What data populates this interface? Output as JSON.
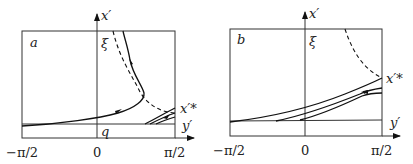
{
  "figure": {
    "panels": [
      {
        "id": "a",
        "panel_label": "a",
        "y_axis_label": "x′",
        "x_axis_label": "y′",
        "top_marker": "ξ",
        "bottom_marker": "q",
        "fixed_point_label": "x′*",
        "x_ticks": [
          "−π/2",
          "0",
          "π/2"
        ]
      },
      {
        "id": "b",
        "panel_label": "b",
        "y_axis_label": "x′",
        "x_axis_label": "y′",
        "top_marker": "ξ",
        "fixed_point_label": "x′*",
        "x_ticks": [
          "−π/2",
          "0",
          "π/2"
        ]
      }
    ]
  }
}
